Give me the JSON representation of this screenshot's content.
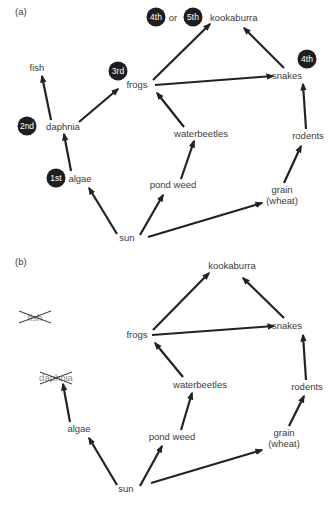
{
  "colors": {
    "arrow": "#222222",
    "text": "#3c3c3c",
    "badge_fill": "#1e1e1e",
    "badge_text": "#ffffff",
    "background": "#ffffff"
  },
  "panels": [
    {
      "label": "(a)",
      "nodes": {
        "kookaburra": "kookaburra",
        "fish": "fish",
        "frogs": "frogs",
        "snakes": "snakes",
        "daphnia": "daphnia",
        "waterbeetles": "waterbeetles",
        "rodents": "rodents",
        "algae": "algae",
        "pond_weed": "pond weed",
        "grain_line1": "grain",
        "grain_line2": "(wheat)",
        "sun": "sun"
      },
      "badges": {
        "kookaburra_a": "4th",
        "kookaburra_or": "or",
        "kookaburra_b": "5th",
        "frogs": "3rd",
        "snakes": "4th",
        "daphnia": "2nd",
        "algae": "1st"
      }
    },
    {
      "label": "(b)",
      "nodes": {
        "kookaburra": "kookaburra",
        "fish": "fish",
        "frogs": "frogs",
        "snakes": "snakes",
        "daphnia": "daphnia",
        "waterbeetles": "waterbeetles",
        "rodents": "rodents",
        "algae": "algae",
        "pond_weed": "pond weed",
        "grain_line1": "grain",
        "grain_line2": "(wheat)",
        "sun": "sun"
      },
      "removed": [
        "fish",
        "daphnia"
      ]
    }
  ],
  "edges": [
    [
      "sun",
      "algae"
    ],
    [
      "sun",
      "pond weed"
    ],
    [
      "sun",
      "grain (wheat)"
    ],
    [
      "algae",
      "daphnia"
    ],
    [
      "daphnia",
      "fish"
    ],
    [
      "daphnia",
      "frogs"
    ],
    [
      "pond weed",
      "waterbeetles"
    ],
    [
      "waterbeetles",
      "frogs"
    ],
    [
      "frogs",
      "kookaburra"
    ],
    [
      "frogs",
      "snakes"
    ],
    [
      "snakes",
      "kookaburra"
    ],
    [
      "grain (wheat)",
      "rodents"
    ],
    [
      "rodents",
      "snakes"
    ]
  ]
}
